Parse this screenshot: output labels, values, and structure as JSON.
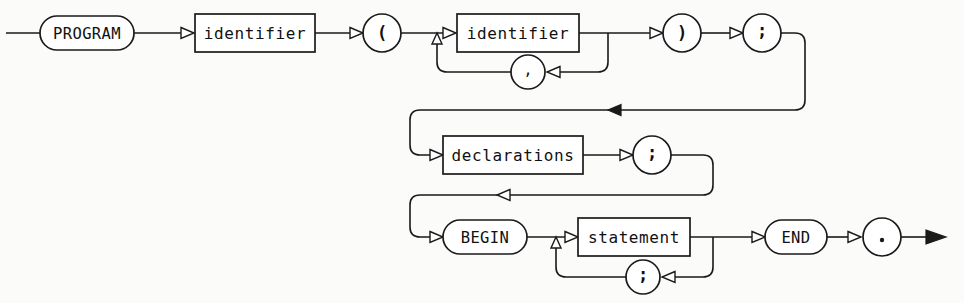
{
  "diagram": {
    "title": "program",
    "kind": "railroad-syntax-diagram",
    "colors": {
      "ink": "#1a1a1a",
      "paper": "#fbfbfa",
      "node_fill": "#ffffff"
    },
    "nodes": {
      "program_keyword": "PROGRAM",
      "identifier_name": "identifier",
      "lparen": "(",
      "identifier_param": "identifier",
      "comma": ",",
      "rparen": ")",
      "semicolon_header": ";",
      "declarations": "declarations",
      "semicolon_decl": ";",
      "begin_keyword": "BEGIN",
      "statement": "statement",
      "semicolon_stmt": ";",
      "end_keyword": "END",
      "period": "."
    },
    "node_kinds": {
      "program_keyword": "terminal-oval",
      "identifier_name": "nonterminal-box",
      "lparen": "terminal-circle",
      "identifier_param": "nonterminal-box",
      "comma": "terminal-circle",
      "rparen": "terminal-circle",
      "semicolon_header": "terminal-circle",
      "declarations": "nonterminal-box",
      "semicolon_decl": "terminal-circle",
      "begin_keyword": "terminal-oval",
      "statement": "nonterminal-box",
      "semicolon_stmt": "terminal-circle",
      "end_keyword": "terminal-oval",
      "period": "terminal-circle"
    },
    "rows": [
      {
        "index": 1,
        "y": 33,
        "sequence": [
          "program_keyword",
          "identifier_name",
          "lparen",
          "identifier_param",
          "rparen",
          "semicolon_header"
        ],
        "loops": [
          {
            "node": "comma",
            "around": "identifier_param",
            "y": 72
          }
        ]
      },
      {
        "index": 2,
        "y": 155,
        "sequence": [
          "declarations",
          "semicolon_decl"
        ],
        "optional": true,
        "repeat": true
      },
      {
        "index": 3,
        "y": 237,
        "sequence": [
          "begin_keyword",
          "statement",
          "end_keyword",
          "period"
        ],
        "loops": [
          {
            "node": "semicolon_stmt",
            "around": "statement",
            "y": 277
          }
        ]
      }
    ],
    "connectors": [
      {
        "name": "header-to-declarations",
        "y": 110,
        "from_x": 805,
        "to_x": 410,
        "arrow_x": 608,
        "direction": "left"
      },
      {
        "name": "declarations-to-begin",
        "y": 195,
        "from_x": 713,
        "to_x": 410,
        "arrow_x": 497,
        "direction": "left"
      }
    ],
    "entry_arrow": {
      "x": 6,
      "y": 33
    },
    "exit_arrow": {
      "x": 940,
      "y": 237
    }
  }
}
